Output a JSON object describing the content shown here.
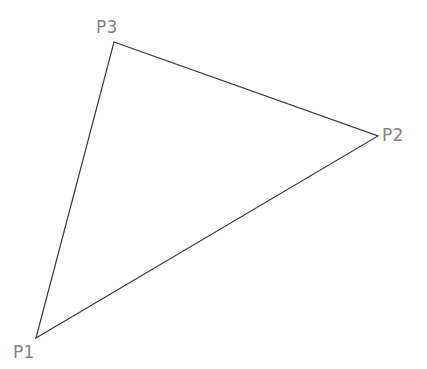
{
  "canvas": {
    "width": 427,
    "height": 369,
    "background_color": "#ffffff"
  },
  "figure": {
    "type": "triangle",
    "stroke_color": "#3a3a3a",
    "stroke_width": 1.2,
    "fill": "none",
    "label_color": "#838383",
    "label_font_size": 17
  },
  "vertices": [
    {
      "id": "p1",
      "label": "P1",
      "x": 36,
      "y": 338,
      "label_x": 13,
      "label_y": 344,
      "label_placement": "below-left"
    },
    {
      "id": "p2",
      "label": "P2",
      "x": 378,
      "y": 136,
      "label_x": 382,
      "label_y": 127,
      "label_placement": "right"
    },
    {
      "id": "p3",
      "label": "P3",
      "x": 114,
      "y": 42,
      "label_x": 96,
      "label_y": 19,
      "label_placement": "above-left"
    }
  ],
  "edges": [
    {
      "id": "edge-p1-p3",
      "from": "p1",
      "to": "p3"
    },
    {
      "id": "edge-p3-p2",
      "from": "p3",
      "to": "p2"
    },
    {
      "id": "edge-p2-p1",
      "from": "p2",
      "to": "p1"
    }
  ],
  "polygon_points": "36,338 114,42 378,136"
}
